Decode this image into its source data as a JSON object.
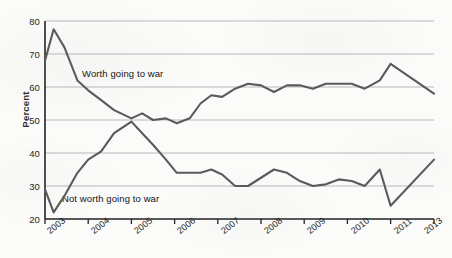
{
  "figure": {
    "background_color": "#fbfbfa",
    "line_color": "#5a5a5a",
    "gridline_color": "#b9b9b9",
    "axis_color": "#222222"
  },
  "chart_data": {
    "type": "line",
    "title": "",
    "subtitle": "",
    "xlabel": "",
    "ylabel": "Percent",
    "ylim": [
      20,
      80
    ],
    "xlim": [
      2003,
      2013
    ],
    "ytick_labels": [
      "20",
      "30",
      "40",
      "50",
      "60",
      "70",
      "80"
    ],
    "ytick_values": [
      20,
      30,
      40,
      50,
      60,
      70,
      80
    ],
    "xtick_labels": [
      "2003",
      "2004",
      "2005",
      "2006",
      "2007",
      "2008",
      "2009",
      "2010",
      "2011",
      "2013"
    ],
    "xtick_values": [
      2003,
      2004,
      2005,
      2006,
      2007,
      2008,
      2009,
      2010,
      2011,
      2013
    ],
    "grid": "horizontal",
    "legend_position": "inline-annotations",
    "annotations": [
      {
        "text": "Worth going to war",
        "x": 2004.0,
        "y": 63.5
      },
      {
        "text": "Not worth going to war",
        "x": 2003.4,
        "y": 26.0
      }
    ],
    "series": [
      {
        "name": "Worth going to war",
        "x": [
          2003.0,
          2003.2,
          2003.45,
          2003.75,
          2004.0,
          2004.3,
          2004.6,
          2005.0,
          2005.25,
          2005.5,
          2005.8,
          2006.05,
          2006.35,
          2006.6,
          2006.85,
          2007.1,
          2007.4,
          2007.7,
          2008.0,
          2008.3,
          2008.6,
          2008.9,
          2009.2,
          2009.5,
          2009.8,
          2010.1,
          2010.4,
          2010.75,
          2011.0,
          2013.0
        ],
        "y": [
          68,
          77.5,
          72,
          62,
          59,
          56,
          53,
          50.5,
          52,
          50,
          50.5,
          49,
          50.5,
          55,
          57.5,
          57,
          59.5,
          61,
          60.5,
          58.5,
          60.5,
          60.5,
          59.5,
          61,
          61,
          61,
          59.5,
          62,
          67,
          58
        ]
      },
      {
        "name": "Not worth going to war",
        "x": [
          2003.0,
          2003.2,
          2003.45,
          2003.75,
          2004.0,
          2004.3,
          2004.6,
          2005.0,
          2005.25,
          2005.5,
          2005.8,
          2006.05,
          2006.35,
          2006.6,
          2006.85,
          2007.1,
          2007.4,
          2007.7,
          2008.0,
          2008.3,
          2008.6,
          2008.9,
          2009.2,
          2009.5,
          2009.8,
          2010.1,
          2010.4,
          2010.75,
          2011.0,
          2013.0
        ],
        "y": [
          29,
          22,
          27,
          34,
          38,
          40.5,
          46,
          49.5,
          46,
          42.5,
          38,
          34,
          34,
          34,
          35,
          33.5,
          30,
          30,
          32.5,
          35,
          34,
          31.5,
          30,
          30.5,
          32,
          31.5,
          30,
          35,
          24,
          38
        ]
      }
    ]
  }
}
